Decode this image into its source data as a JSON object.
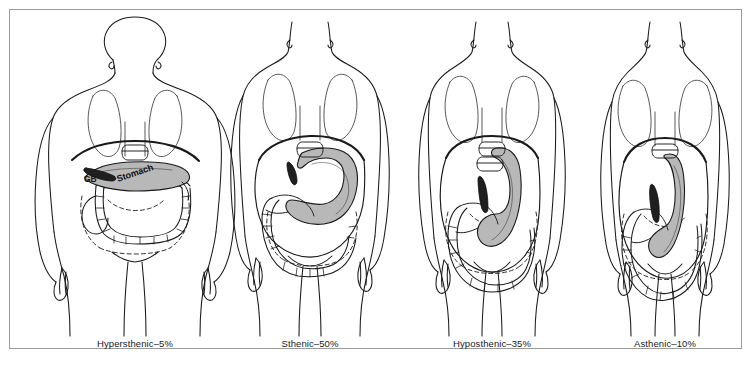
{
  "figure": {
    "frame_border_color": "#9a9a9a",
    "background_color": "#ffffff",
    "line_color": "#1a1a1a",
    "organ_fill_gray": "#b8b8b8",
    "gallbladder_fill": "#1f1f1f"
  },
  "panels": [
    {
      "id": "hypersthenic",
      "label": "Hypersthenic–5%",
      "label_x": 135,
      "center_x": 135,
      "has_head": true,
      "annotations": [
        {
          "name": "gallbladder",
          "text": "GB",
          "x": 88,
          "y": 180,
          "rotate": 0
        },
        {
          "name": "stomach",
          "text": "Stomach",
          "x": 122,
          "y": 180,
          "rotate": -19
        }
      ]
    },
    {
      "id": "sthenic",
      "label": "Sthenic–50%",
      "label_x": 310,
      "center_x": 310,
      "has_head": false,
      "annotations": []
    },
    {
      "id": "hyposthenic",
      "label": "Hyposthenic–35%",
      "label_x": 492,
      "center_x": 492,
      "has_head": false,
      "annotations": []
    },
    {
      "id": "asthenic",
      "label": "Asthenic–10%",
      "label_x": 665,
      "center_x": 665,
      "has_head": false,
      "annotations": []
    }
  ],
  "caption_y": 344
}
